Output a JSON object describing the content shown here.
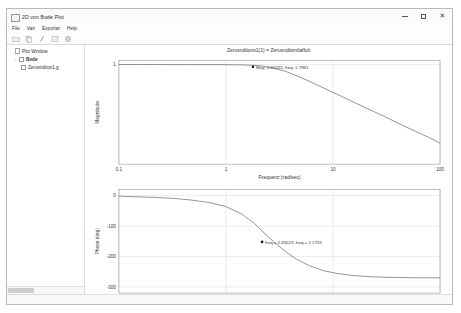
{
  "window": {
    "title": "2D von Bode Plot",
    "icon": "window-plot-icon",
    "minimize_label": "–",
    "maximize_label": "□",
    "close_label": "✕"
  },
  "menu": {
    "items": [
      {
        "label": "File",
        "name": "menu-file"
      },
      {
        "label": "Vari",
        "name": "menu-view"
      },
      {
        "label": "Exportar",
        "name": "menu-export"
      },
      {
        "label": "Help",
        "name": "menu-help"
      }
    ]
  },
  "toolbar": {
    "buttons": [
      {
        "name": "open-icon",
        "glyph": "folder"
      },
      {
        "name": "copy-icon",
        "glyph": "copy"
      },
      {
        "name": "cursor-icon",
        "glyph": "cursor"
      },
      {
        "name": "grid-icon",
        "glyph": "grid"
      },
      {
        "name": "settings-icon",
        "glyph": "gear"
      }
    ]
  },
  "tree": {
    "root": {
      "label": "Plot Window",
      "name": "tree-item-plot-window"
    },
    "group": {
      "label": "Bode",
      "name": "tree-item-bode",
      "expander": "−"
    },
    "child": {
      "label": "Zerusndtion1.g",
      "name": "tree-item-zerusndtion1g"
    }
  },
  "plot": {
    "title": "Zerusndtions1(1) = Zerusndtiontlaffuit",
    "colors": {
      "curve": "#4a4a4a",
      "grid": "#d8d8d8",
      "axis": "#808080",
      "marker": "#111111",
      "text": "#333333"
    }
  },
  "chart_data": [
    {
      "type": "line",
      "name": "magnitude",
      "title": "Zerusndtions1(1) = Zerusndtiontlaffuit",
      "xlabel": "Frequenz (rad/sec)",
      "ylabel": "Magnitude",
      "xscale": "log",
      "yscale": "log",
      "xlim": [
        0.1,
        100
      ],
      "ylim": [
        0.0002,
        1.4
      ],
      "xticks": [
        0.1,
        1,
        10,
        100
      ],
      "xticklabels": [
        "0.1",
        "1",
        "10",
        "100"
      ],
      "yticks": [
        1
      ],
      "yticklabels": [
        "1"
      ],
      "grid": true,
      "x": [
        0.1,
        0.15,
        0.22,
        0.32,
        0.46,
        0.68,
        1.0,
        1.4,
        1.8,
        2.2,
        2.8,
        3.6,
        4.6,
        6.0,
        8.0,
        11.0,
        15.0,
        21.0,
        30.0,
        42.0,
        60.0,
        80.0,
        100.0
      ],
      "y": [
        1.0,
        1.0,
        1.0,
        0.999,
        0.998,
        0.996,
        0.99,
        0.972,
        0.94,
        0.88,
        0.74,
        0.56,
        0.38,
        0.24,
        0.14,
        0.078,
        0.043,
        0.023,
        0.012,
        0.0062,
        0.0032,
        0.0019,
        0.0012
      ],
      "annotation": {
        "text": "Mag: 0.82225, freq: 1.7881",
        "x": 1.7881,
        "y": 0.82225
      }
    },
    {
      "type": "line",
      "name": "phase",
      "xlabel": "Frequenz (rad/sec)",
      "ylabel": "Phase (deg)",
      "xscale": "log",
      "xlim": [
        0.1,
        100
      ],
      "ylim": [
        -320,
        20
      ],
      "xticks": [
        0.1,
        1,
        10,
        100
      ],
      "xticklabels": [
        "0.1",
        "1",
        "10",
        "100"
      ],
      "yticks": [
        0,
        -100,
        -200,
        -300
      ],
      "yticklabels": [
        "0",
        "-100",
        "-200",
        "-300"
      ],
      "grid": true,
      "x": [
        0.1,
        0.15,
        0.22,
        0.32,
        0.46,
        0.68,
        1.0,
        1.4,
        1.8,
        2.2,
        2.8,
        3.6,
        4.6,
        6.0,
        8.0,
        11.0,
        15.0,
        21.0,
        30.0,
        42.0,
        60.0,
        80.0,
        100.0
      ],
      "y": [
        -2,
        -4,
        -6,
        -9,
        -14,
        -22,
        -36,
        -60,
        -88,
        -118,
        -152,
        -184,
        -210,
        -230,
        -246,
        -256,
        -262,
        -266,
        -268,
        -269,
        -270,
        -270,
        -270
      ],
      "annotation": {
        "text": "freq = 2.83223, freq = 2.1759",
        "x": 2.1759,
        "y": -152
      }
    }
  ]
}
